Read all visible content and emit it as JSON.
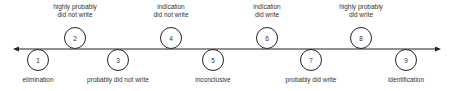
{
  "scale": [
    {
      "n": "1",
      "label": "elimination",
      "x": 38,
      "pos": "below"
    },
    {
      "n": "2",
      "label": "highly probably\ndid not write",
      "x": 75,
      "pos": "above"
    },
    {
      "n": "3",
      "label": "probably did not write",
      "x": 118,
      "pos": "below"
    },
    {
      "n": "4",
      "label": "indication\ndid not write",
      "x": 171,
      "pos": "above"
    },
    {
      "n": "5",
      "label": "inconclusive",
      "x": 213,
      "pos": "below"
    },
    {
      "n": "6",
      "label": "indication\ndid write",
      "x": 267,
      "pos": "above"
    },
    {
      "n": "7",
      "label": "probably did write",
      "x": 311,
      "pos": "below"
    },
    {
      "n": "8",
      "label": "highly probably\ndid write",
      "x": 361,
      "pos": "above"
    },
    {
      "n": "9",
      "label": "identification",
      "x": 406,
      "pos": "below"
    }
  ],
  "colors": {
    "line": "#222222",
    "circle": "#222222",
    "text": "#333333"
  }
}
